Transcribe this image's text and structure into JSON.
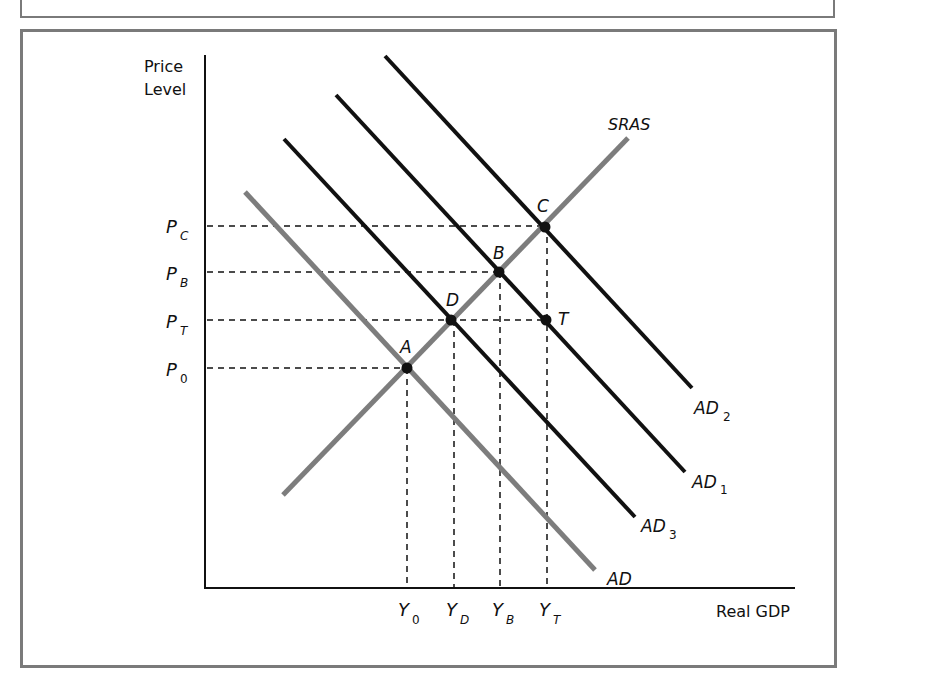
{
  "diagram": {
    "axes": {
      "y_label_line1": "Price",
      "y_label_line2": "Level",
      "x_label": "Real GDP"
    },
    "price_levels": [
      {
        "id": "PC",
        "base": "P",
        "sub": "C"
      },
      {
        "id": "PB",
        "base": "P",
        "sub": "B"
      },
      {
        "id": "PT",
        "base": "P",
        "sub": "T"
      },
      {
        "id": "P0",
        "base": "P",
        "sub": "0"
      }
    ],
    "output_levels": [
      {
        "id": "Y0",
        "base": "Y",
        "sub": "0"
      },
      {
        "id": "YD",
        "base": "Y",
        "sub": "D"
      },
      {
        "id": "YB",
        "base": "Y",
        "sub": "B"
      },
      {
        "id": "YT",
        "base": "Y",
        "sub": "T"
      }
    ],
    "curves": [
      {
        "id": "SRAS",
        "label": "SRAS",
        "sub": "",
        "color": "#7d7d7d"
      },
      {
        "id": "AD",
        "label": "AD",
        "sub": "",
        "color": "#7d7d7d"
      },
      {
        "id": "AD3",
        "label": "AD",
        "sub": "3",
        "color": "#111111"
      },
      {
        "id": "AD1",
        "label": "AD",
        "sub": "1",
        "color": "#111111"
      },
      {
        "id": "AD2",
        "label": "AD",
        "sub": "2",
        "color": "#111111"
      }
    ],
    "points": [
      {
        "id": "A",
        "label": "A",
        "on": "SRAS ∩ AD",
        "price": "P0",
        "output": "Y0"
      },
      {
        "id": "D",
        "label": "D",
        "on": "SRAS ∩ AD3",
        "price": "PT",
        "output": "YD"
      },
      {
        "id": "B",
        "label": "B",
        "on": "SRAS ∩ AD1",
        "price": "PB",
        "output": "YB"
      },
      {
        "id": "C",
        "label": "C",
        "on": "SRAS ∩ AD2",
        "price": "PC",
        "output": "YT"
      },
      {
        "id": "T",
        "label": "T",
        "on": "AD1",
        "price": "PT",
        "output": "YT"
      }
    ]
  }
}
